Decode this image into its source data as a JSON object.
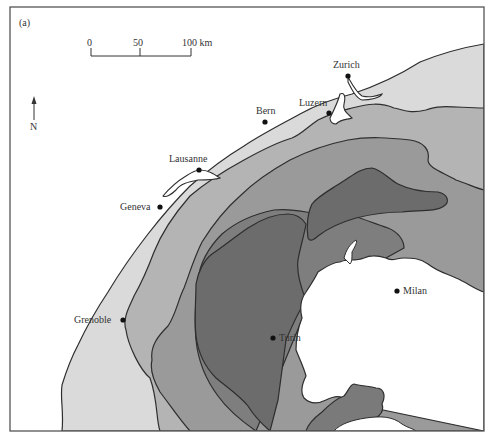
{
  "figure": {
    "panel_label": "(a)"
  },
  "scale_bar": {
    "ticks": [
      "0",
      "50",
      "100 km"
    ]
  },
  "north_arrow": {
    "label": "N"
  },
  "cities": [
    {
      "name": "Zurich"
    },
    {
      "name": "Luzern"
    },
    {
      "name": "Bern"
    },
    {
      "name": "Lausanne"
    },
    {
      "name": "Geneva"
    },
    {
      "name": "Grenoble"
    },
    {
      "name": "Turin"
    },
    {
      "name": "Milan"
    }
  ],
  "colors": {
    "frame": "#555555",
    "background": "#ffffff",
    "zone_1": "#dadada",
    "zone_2": "#b4b4b4",
    "zone_3": "#9a9a9a",
    "zone_4": "#7e7e7e",
    "zone_5": "#6c6c6c",
    "outline": "#2e2e2e",
    "lake": "#ffffff"
  }
}
